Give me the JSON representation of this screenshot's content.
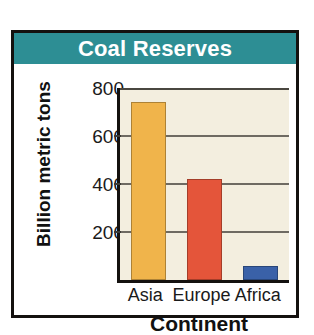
{
  "figure": {
    "title": "Coal Reserves",
    "title_band_color": "#2d8e94",
    "frame_color": "#14110f",
    "plot_background": "#f3eedf"
  },
  "chart_data": {
    "type": "bar",
    "title": "Coal Reserves",
    "xlabel": "Continent",
    "ylabel": "Billion metric tons",
    "categories": [
      "Asia",
      "Europe",
      "Africa"
    ],
    "values": [
      740,
      420,
      60
    ],
    "bar_colors": [
      "#f0b44b",
      "#e4553a",
      "#3a61a8"
    ],
    "ylim": [
      0,
      800
    ],
    "yticks": [
      200,
      400,
      600,
      800
    ],
    "ytick_labels": [
      "200",
      "400",
      "600",
      "800"
    ],
    "grid": true,
    "legend": "none",
    "units": "billion metric tons"
  }
}
